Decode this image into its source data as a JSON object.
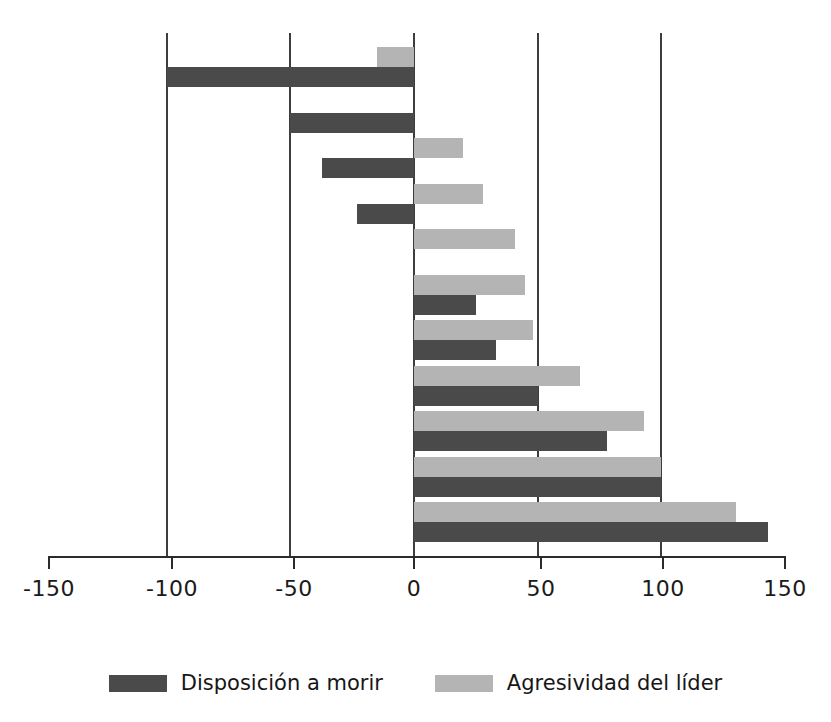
{
  "chart_data": {
    "type": "bar",
    "orientation": "horizontal",
    "title": "",
    "xlabel": "",
    "ylabel": "",
    "xlim": [
      -150,
      150
    ],
    "xticks": [
      -150,
      -100,
      -50,
      0,
      50,
      100,
      150
    ],
    "xtick_labels": [
      "-150",
      "-100",
      "-50",
      "0",
      "50",
      "100",
      "150"
    ],
    "gridlines_at": [
      -100,
      -50,
      0,
      50,
      100
    ],
    "grid": true,
    "legend_position": "bottom",
    "categories": [
      "1",
      "2",
      "3",
      "4",
      "5",
      "6",
      "7",
      "8",
      "9",
      "10",
      "11"
    ],
    "series": [
      {
        "name": "Agresividad del líder",
        "color": "#b4b4b4",
        "values": [
          -15,
          null,
          20,
          28,
          41,
          45,
          48,
          67,
          93,
          100,
          130
        ]
      },
      {
        "name": "Disposición a morir",
        "color": "#4a4a4a",
        "values": [
          -100,
          -50,
          -37,
          -23,
          null,
          25,
          33,
          50,
          78,
          100,
          143
        ]
      }
    ]
  },
  "axis": {
    "ticks": [
      {
        "value": -150,
        "label": "-150",
        "x": 49
      },
      {
        "value": -100,
        "label": "-100",
        "x": 172
      },
      {
        "value": -50,
        "label": "-50",
        "x": 294
      },
      {
        "value": 0,
        "label": "0",
        "x": 414
      },
      {
        "value": 50,
        "label": "50",
        "x": 541
      },
      {
        "value": 100,
        "label": "100",
        "x": 663
      },
      {
        "value": 150,
        "label": "150",
        "x": 785
      }
    ]
  },
  "legend": {
    "items": [
      {
        "label": "Disposición a morir",
        "swatch": "dark"
      },
      {
        "label": "Agresividad del líder",
        "swatch": "light"
      }
    ]
  },
  "colors": {
    "dark_bar": "#4a4a4a",
    "light_bar": "#b4b4b4",
    "gridline": "#3d3d3d",
    "axis": "#2b2b2b",
    "background": "#ffffff"
  }
}
